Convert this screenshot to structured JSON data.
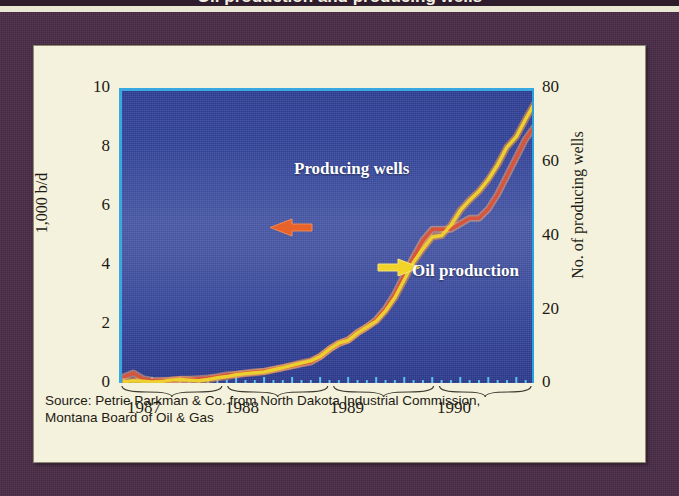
{
  "figure": {
    "headline_strip": "Oil production and producing wells",
    "frame_color": "#4a2b46",
    "card_color": "#f4f1dc",
    "plot_background": "#3a4aa0",
    "accent_cyan": "#37a9e0"
  },
  "axes": {
    "left": {
      "title": "1,000 b/d",
      "ticks": [
        "0",
        "2",
        "4",
        "6",
        "8",
        "10"
      ],
      "min": 0,
      "max": 10
    },
    "right": {
      "title": "No. of producing wells",
      "ticks": [
        "0",
        "20",
        "40",
        "60",
        "80"
      ],
      "min": 0,
      "max": 80
    },
    "x": {
      "years": [
        "1987",
        "1988",
        "1989",
        "1990"
      ]
    }
  },
  "annotations": [
    {
      "label": "Producing wells",
      "arrow": "left-arrow-icon",
      "arrow_color": "#e8622c"
    },
    {
      "label": "Oil production",
      "arrow": "right-arrow-icon",
      "arrow_color": "#f2d32a"
    }
  ],
  "caption": {
    "line1": "Source: Petrie Parkman & Co. from North Dakota Industrial Commission,",
    "line2": "Montana Board of Oil & Gas"
  },
  "chart_data": {
    "type": "line",
    "title": "Oil production and producing wells",
    "xlabel": "",
    "ylabel": "1,000 b/d",
    "y2label": "No. of producing wells",
    "ylim": [
      0,
      10
    ],
    "y2lim": [
      0,
      80
    ],
    "grid": false,
    "legend": "in-plot annotations with arrows",
    "x_tick_labels": [
      "1987",
      "1988",
      "1989",
      "1990"
    ],
    "x_minor_ticks": "monthly",
    "x": [
      "1987-01",
      "1987-02",
      "1987-03",
      "1987-04",
      "1987-05",
      "1987-06",
      "1987-07",
      "1987-08",
      "1987-09",
      "1987-10",
      "1987-11",
      "1987-12",
      "1988-01",
      "1988-02",
      "1988-03",
      "1988-04",
      "1988-05",
      "1988-06",
      "1988-07",
      "1988-08",
      "1988-09",
      "1988-10",
      "1988-11",
      "1988-12",
      "1989-01",
      "1989-02",
      "1989-03",
      "1989-04",
      "1989-05",
      "1989-06",
      "1989-07",
      "1989-08",
      "1989-09",
      "1989-10",
      "1989-11",
      "1989-12",
      "1990-01",
      "1990-02",
      "1990-03",
      "1990-04",
      "1990-05",
      "1990-06",
      "1990-07",
      "1990-08",
      "1990-09"
    ],
    "series": [
      {
        "name": "Oil production",
        "axis": "left",
        "units": "1,000 b/d",
        "color": "#ecd02f",
        "values": [
          0.15,
          0.18,
          0.16,
          0.14,
          0.15,
          0.2,
          0.22,
          0.2,
          0.18,
          0.22,
          0.28,
          0.32,
          0.38,
          0.42,
          0.45,
          0.48,
          0.55,
          0.62,
          0.7,
          0.78,
          0.85,
          1.0,
          1.25,
          1.45,
          1.55,
          1.8,
          2.0,
          2.2,
          2.55,
          3.0,
          3.6,
          4.2,
          4.65,
          5.05,
          5.1,
          5.45,
          5.95,
          6.3,
          6.6,
          7.0,
          7.5,
          8.1,
          8.45,
          9.05,
          9.6
        ]
      },
      {
        "name": "Producing wells",
        "axis": "right",
        "units": "number of wells",
        "color": "#d9543a",
        "values": [
          2.5,
          3.5,
          2.0,
          1.5,
          1.5,
          1.5,
          1.8,
          1.8,
          2.0,
          2.2,
          2.5,
          3.0,
          3.2,
          3.5,
          3.8,
          4.0,
          4.5,
          5.0,
          5.5,
          6.0,
          6.5,
          8.0,
          10.0,
          11.5,
          12.5,
          14.5,
          16.0,
          18.0,
          21.0,
          25.0,
          30.0,
          35.0,
          39.5,
          42.5,
          42.5,
          42.5,
          44.0,
          45.5,
          45.5,
          48.0,
          52.0,
          57.0,
          62.0,
          67.0,
          70.5
        ]
      }
    ]
  }
}
